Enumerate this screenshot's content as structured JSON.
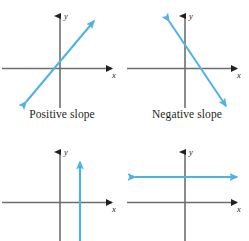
{
  "figure": {
    "background_color": "#ffffff",
    "axis_color": "#6d6e71",
    "axis_arrow_color": "#231f20",
    "line_color": "#4eb3e3",
    "text_color": "#231f20",
    "width": 249,
    "height": 241
  },
  "panels": [
    {
      "id": "positive-slope",
      "caption": "Positive slope",
      "x_axis_label": "x",
      "y_axis_label": "y",
      "line": {
        "slope_sign": "positive",
        "description": "line rising left to right with arrowheads on both ends",
        "arrowheads": "both"
      }
    },
    {
      "id": "negative-slope",
      "caption": "Negative slope",
      "x_axis_label": "x",
      "y_axis_label": "y",
      "line": {
        "slope_sign": "negative",
        "description": "line falling left to right with arrowheads on both ends",
        "arrowheads": "both"
      }
    },
    {
      "id": "undefined-slope",
      "caption": "",
      "x_axis_label": "x",
      "y_axis_label": "y",
      "line": {
        "slope_sign": "undefined",
        "description": "vertical line right of the y-axis with an arrowhead pointing up",
        "arrowheads": "both"
      }
    },
    {
      "id": "zero-slope",
      "caption": "",
      "x_axis_label": "x",
      "y_axis_label": "y",
      "line": {
        "slope_sign": "zero",
        "description": "horizontal line above the x-axis with arrowheads on both ends",
        "arrowheads": "both"
      }
    }
  ]
}
